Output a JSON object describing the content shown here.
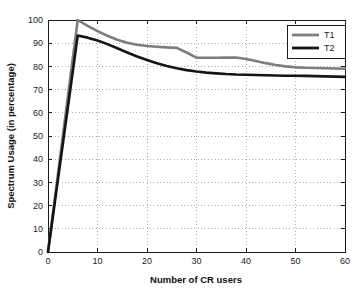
{
  "chart_data": {
    "type": "line",
    "title": "",
    "xlabel": "Number of CR users",
    "ylabel": "Spectrum Usage (in percentage)",
    "xlim": [
      0,
      60
    ],
    "ylim": [
      0,
      100
    ],
    "xticks": [
      0,
      10,
      20,
      30,
      40,
      50,
      60
    ],
    "yticks": [
      0,
      10,
      20,
      30,
      40,
      50,
      60,
      70,
      80,
      90,
      100
    ],
    "grid": true,
    "legend_position": "upper right",
    "legend_entries": [
      "T1",
      "T2"
    ],
    "series": [
      {
        "name": "T1",
        "color": "#7d7d7d",
        "linewidth": 2.6,
        "x": [
          0,
          6,
          8,
          10,
          12,
          14,
          16,
          18,
          20,
          22,
          24,
          26,
          28,
          30,
          32,
          34,
          36,
          38,
          40,
          42,
          44,
          46,
          48,
          50,
          52,
          54,
          56,
          58,
          60
        ],
        "y": [
          0,
          100,
          97.5,
          95.2,
          93.2,
          91.5,
          90.2,
          89.3,
          88.8,
          88.5,
          88.2,
          88.0,
          86.0,
          83.8,
          83.7,
          83.7,
          83.8,
          83.8,
          83.2,
          82.3,
          81.4,
          80.6,
          80.0,
          79.6,
          79.4,
          79.3,
          79.2,
          79.1,
          79.0
        ]
      },
      {
        "name": "T2",
        "color": "#141414",
        "linewidth": 2.6,
        "x": [
          0,
          6,
          8,
          10,
          12,
          14,
          16,
          18,
          20,
          22,
          24,
          26,
          28,
          30,
          32,
          34,
          36,
          38,
          40,
          42,
          44,
          46,
          48,
          50,
          52,
          54,
          56,
          58,
          60
        ],
        "y": [
          0,
          93.3,
          92.4,
          91.2,
          89.6,
          87.8,
          86.0,
          84.3,
          82.8,
          81.4,
          80.2,
          79.2,
          78.4,
          77.8,
          77.3,
          77.0,
          76.7,
          76.5,
          76.4,
          76.3,
          76.2,
          76.1,
          76.0,
          76.0,
          75.9,
          75.8,
          75.7,
          75.6,
          75.5
        ]
      }
    ]
  },
  "axes": {
    "x_tick_labels": [
      "0",
      "10",
      "20",
      "30",
      "40",
      "50",
      "60"
    ],
    "y_tick_labels": [
      "0",
      "10",
      "20",
      "30",
      "40",
      "50",
      "60",
      "70",
      "80",
      "90",
      "100"
    ]
  },
  "legend": {
    "items": [
      {
        "label": "T1"
      },
      {
        "label": "T2"
      }
    ]
  },
  "colors": {
    "series_t1": "#7d7d7d",
    "series_t2": "#141414",
    "grid": "#9a9a9a",
    "axis": "#1a1a1a",
    "background": "#ffffff"
  }
}
